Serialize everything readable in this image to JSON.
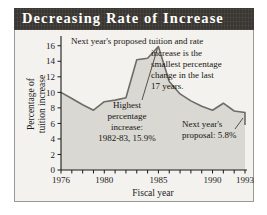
{
  "title": "Decreasing Rate of Increase",
  "colors": {
    "title_bar_bg": "#3a3732",
    "title_text": "#ffffff",
    "panel_bg": "#f3f2ee",
    "area_fill": "#d9d8d3",
    "line": "#6e6c66",
    "axis": "#1b1b1b",
    "frame": "#9a9a94"
  },
  "annotations": {
    "top_line1": "Next year's proposed tuition and rate",
    "top_line2": "increase is the",
    "top_line3": "smallest percentage",
    "top_line4": "change in the last",
    "top_line5": "17 years.",
    "peak_line1": "Highest",
    "peak_line2": "percentage",
    "peak_line3": "increase:",
    "peak_line4": "1982-83, 15.9%",
    "end_line1": "Next year's",
    "end_line2": "proposal: 5.8%"
  },
  "chart_data": {
    "type": "area",
    "title": "Decreasing Rate of Increase",
    "xlabel": "Fiscal year",
    "ylabel": "Percentage of tuition increase",
    "xlim": [
      1976,
      1993
    ],
    "ylim": [
      0,
      17
    ],
    "yticks": [
      0,
      2,
      4,
      6,
      8,
      10,
      12,
      14,
      16
    ],
    "ytick_labels": [
      "0",
      "2",
      "4",
      "6",
      "8",
      "10",
      "12",
      "14",
      "16"
    ],
    "xticks": [
      1976,
      1977,
      1978,
      1979,
      1980,
      1981,
      1982,
      1983,
      1984,
      1985,
      1986,
      1987,
      1988,
      1989,
      1990,
      1991,
      1992,
      1993
    ],
    "xtick_labels_shown": [
      "1976",
      "1980",
      "1985",
      "1990",
      "1993"
    ],
    "xtick_labels_shown_at": [
      1976,
      1980,
      1985,
      1990,
      1993
    ],
    "grid": false,
    "legend": false,
    "x": [
      1976,
      1977,
      1978,
      1979,
      1980,
      1981,
      1982,
      1983,
      1984,
      1985,
      1986,
      1987,
      1988,
      1989,
      1990,
      1991,
      1992,
      1993
    ],
    "values": [
      10.0,
      9.2,
      8.4,
      7.7,
      8.8,
      9.0,
      9.3,
      14.2,
      14.4,
      15.9,
      11.4,
      9.8,
      8.9,
      8.2,
      7.7,
      8.6,
      7.6,
      7.4
    ],
    "final_value": 5.8,
    "peak_value": 15.9,
    "peak_year": "1982-83"
  }
}
